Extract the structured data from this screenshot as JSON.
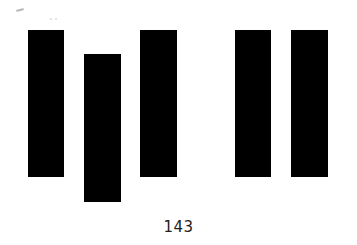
{
  "figure": {
    "bar_color": "#000000",
    "bars": [
      {
        "left": 28,
        "top": 30,
        "width": 36,
        "height": 147
      },
      {
        "left": 84,
        "top": 54,
        "width": 37,
        "height": 148
      },
      {
        "left": 140,
        "top": 30,
        "width": 37,
        "height": 147
      },
      {
        "left": 235,
        "top": 30,
        "width": 36,
        "height": 147
      },
      {
        "left": 291,
        "top": 30,
        "width": 37,
        "height": 147
      }
    ]
  },
  "footer": {
    "page_number": "143"
  }
}
